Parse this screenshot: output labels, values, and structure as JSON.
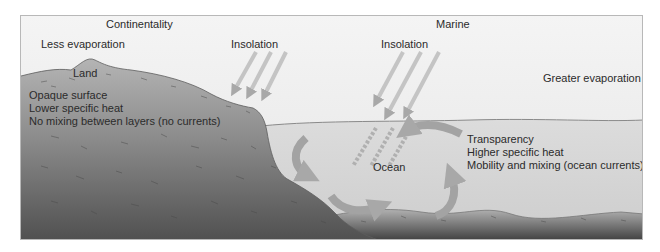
{
  "diagram": {
    "headings": {
      "left": "Continentality",
      "right": "Marine"
    },
    "land": {
      "evaporation": "Less evaporation",
      "name": "Land",
      "properties": [
        "Opaque surface",
        "Lower specific heat",
        "No mixing between layers (no currents)"
      ]
    },
    "ocean": {
      "evaporation": "Greater evaporation",
      "name": "Ocean",
      "properties": [
        "Transparency",
        "Higher specific heat",
        "Mobility and mixing (ocean currents)"
      ]
    },
    "insolation": {
      "land_label": "Insolation",
      "ocean_label": "Insolation"
    },
    "colors": {
      "sky": "#efefef",
      "ocean": "#d6d6d6",
      "land_dark": "#5a5a5a",
      "land_light": "#bdbdbd",
      "arrows": "#a3a3a3",
      "text": "#2b2b2b"
    }
  }
}
